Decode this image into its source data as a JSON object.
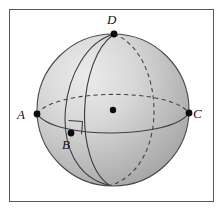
{
  "figure": {
    "kind": "geometry-diagram",
    "frame": {
      "border_color": "#58585c",
      "background_color": "#ffffff"
    },
    "sphere": {
      "center_x": 113,
      "center_y": 110,
      "radius": 76,
      "fill_light": "#e8e8e8",
      "fill_dark": "#a9a9a9",
      "outline_color": "#4a4a4e"
    },
    "points": [
      {
        "id": "A",
        "label": "A",
        "x": 37,
        "y": 114,
        "dot_radius": 3.4
      },
      {
        "id": "B",
        "label": "B",
        "x": 71,
        "y": 133,
        "dot_radius": 3.4
      },
      {
        "id": "C",
        "label": "C",
        "x": 189,
        "y": 113,
        "dot_radius": 3.4
      },
      {
        "id": "D",
        "label": "D",
        "x": 114,
        "y": 34,
        "dot_radius": 3.4
      },
      {
        "id": "O",
        "label": "",
        "x": 113,
        "y": 110,
        "dot_radius": 3.2
      }
    ],
    "labels": {
      "A": "A",
      "B": "B",
      "C": "C",
      "D": "D"
    },
    "right_angle_mark": {
      "at_point": "B",
      "size": 13,
      "color": "#3a3a3e"
    },
    "curves": {
      "equator_front_style": "solid",
      "equator_back_style": "dashed",
      "meridian_front_style": "solid",
      "meridian_back_style": "dashed",
      "stroke_color": "#4a4a4e"
    }
  }
}
